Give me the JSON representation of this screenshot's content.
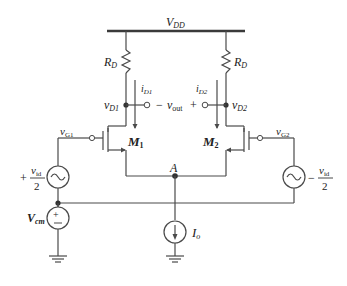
{
  "labels": {
    "supply": "V",
    "supply_sub": "DD",
    "rd_left": "R",
    "rd_left_sub": "D",
    "rd_right": "R",
    "rd_right_sub": "D",
    "id1": "i",
    "id1_sub": "D1",
    "id2": "i",
    "id2_sub": "D2",
    "vd1": "v",
    "vd1_sub": "D1",
    "vd2": "v",
    "vd2_sub": "D2",
    "vout_minus": "−",
    "vout": "v",
    "vout_sub": "out",
    "vout_plus": "+",
    "vg1": "v",
    "vg1_sub": "G1",
    "vg2": "v",
    "vg2_sub": "G2",
    "m1": "M",
    "m1_sub": "1",
    "m2": "M",
    "m2_sub": "2",
    "node_a": "A",
    "vid_left_sign": "+",
    "vid_num": "v",
    "vid_num_sub": "id",
    "vid_den": "2",
    "vid_right_sign": "−",
    "vcm": "V",
    "vcm_sub": "cm",
    "io": "I",
    "io_sub": "o"
  },
  "colors": {
    "wire": "#4a4a4a",
    "text": "#222222",
    "background": "#ffffff"
  }
}
